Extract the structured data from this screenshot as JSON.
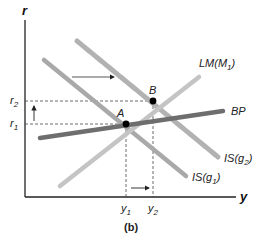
{
  "figure": {
    "caption": "(b)",
    "axes": {
      "y_label": "r",
      "x_label": "y"
    },
    "ticks": {
      "r2": {
        "main": "r",
        "sub": "2"
      },
      "r1": {
        "main": "r",
        "sub": "1"
      },
      "y1": {
        "main": "y",
        "sub": "1"
      },
      "y2": {
        "main": "y",
        "sub": "2"
      }
    },
    "curves": {
      "lm": {
        "main": "LM(M",
        "sub": "1",
        "close": ")"
      },
      "bp": {
        "label": "BP"
      },
      "is_g2": {
        "main": "IS(g",
        "sub": "2",
        "close": ")"
      },
      "is_g1": {
        "main": "IS(g",
        "sub": "1",
        "close": ")"
      }
    },
    "points": {
      "a": "A",
      "b": "B"
    },
    "colors": {
      "is_line": "#a9a9a9",
      "lm_line": "#c4c4c4",
      "bp_line": "#6e6e6e",
      "axis": "#222222",
      "dashed": "#444444",
      "point": "#000000"
    }
  }
}
